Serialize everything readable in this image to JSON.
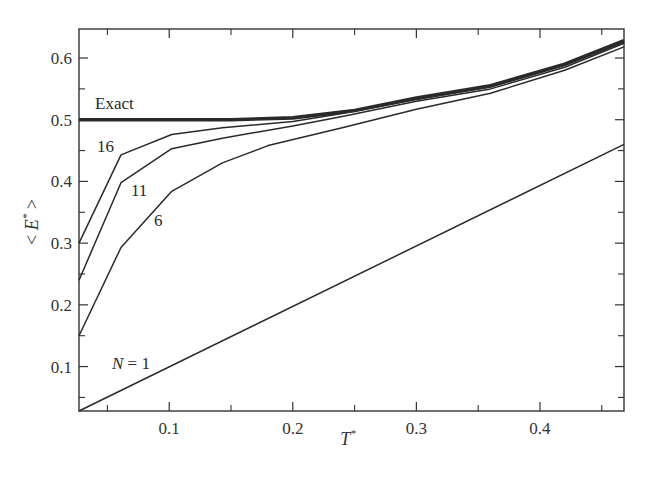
{
  "chart_data": {
    "type": "line",
    "title": "",
    "xlabel": "T*",
    "ylabel": "< E* >",
    "xlim": [
      0.027,
      0.468
    ],
    "ylim": [
      0.028,
      0.647
    ],
    "grid": false,
    "legend": "inline labels",
    "x_ticks": [
      0.1,
      0.2,
      0.3,
      0.4
    ],
    "x_tick_labels": [
      "0.1",
      "0.2",
      "0.3",
      "0.4"
    ],
    "x_minor_ticks": [
      0.05,
      0.15,
      0.25,
      0.35,
      0.45
    ],
    "y_ticks": [
      0.1,
      0.2,
      0.3,
      0.4,
      0.5,
      0.6
    ],
    "y_tick_labels": [
      "0.1",
      "0.2",
      "0.3",
      "0.4",
      "0.5",
      "0.6"
    ],
    "y_minor_ticks": [
      0.05,
      0.15,
      0.25,
      0.35,
      0.45,
      0.55
    ],
    "series": [
      {
        "name": "Exact",
        "label": "Exact",
        "thick": true,
        "x": [
          0.027,
          0.1,
          0.15,
          0.2,
          0.25,
          0.3,
          0.36,
          0.42,
          0.468
        ],
        "y": [
          0.5,
          0.5,
          0.5,
          0.503,
          0.515,
          0.535,
          0.555,
          0.59,
          0.628
        ]
      },
      {
        "name": "N = 16",
        "label": "16",
        "x": [
          0.027,
          0.061,
          0.102,
          0.143,
          0.2,
          0.24,
          0.3,
          0.36,
          0.42,
          0.468
        ],
        "y": [
          0.3,
          0.443,
          0.476,
          0.487,
          0.497,
          0.51,
          0.533,
          0.553,
          0.588,
          0.626
        ]
      },
      {
        "name": "N = 11",
        "label": "11",
        "x": [
          0.027,
          0.061,
          0.102,
          0.143,
          0.2,
          0.24,
          0.3,
          0.36,
          0.42,
          0.468
        ],
        "y": [
          0.24,
          0.398,
          0.453,
          0.47,
          0.49,
          0.505,
          0.53,
          0.55,
          0.585,
          0.624
        ]
      },
      {
        "name": "N = 6",
        "label": "6",
        "x": [
          0.027,
          0.061,
          0.102,
          0.143,
          0.18,
          0.24,
          0.3,
          0.36,
          0.42,
          0.468
        ],
        "y": [
          0.15,
          0.293,
          0.384,
          0.43,
          0.458,
          0.487,
          0.517,
          0.543,
          0.58,
          0.618
        ]
      },
      {
        "name": "N = 1",
        "label": "N = 1",
        "x": [
          0.027,
          0.468
        ],
        "y": [
          0.028,
          0.46
        ]
      }
    ]
  },
  "labels": {
    "top_caption": "… energy of the harmonic oscillator …"
  }
}
